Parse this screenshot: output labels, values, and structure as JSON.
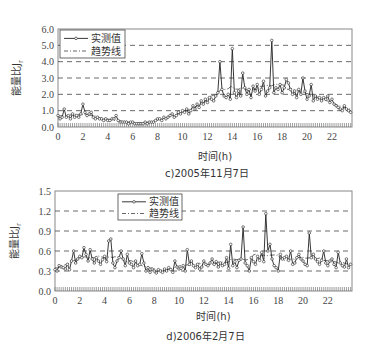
{
  "chart_data": [
    {
      "id": "c",
      "type": "line",
      "caption": "c)2005年11月7日",
      "xlabel": "时间(h)",
      "ylabel": "能量比J",
      "ylabel_sub": "r",
      "xlim": [
        0,
        23.7
      ],
      "ylim": [
        0,
        6.0
      ],
      "xticks": [
        0,
        2,
        4,
        6,
        8,
        10,
        12,
        14,
        16,
        18,
        20,
        22
      ],
      "yticks": [
        "0.0",
        "1.0",
        "2.0",
        "3.0",
        "4.0",
        "5.0",
        "6.0"
      ],
      "grid": "horizontal dashed",
      "legend": {
        "position": "upper left",
        "entries": [
          "实测值",
          "趋势线"
        ]
      },
      "series": [
        {
          "name": "实测值",
          "style": "solid line with circle markers",
          "x_step_h": 0.1667,
          "values": [
            0.7,
            0.5,
            0.6,
            1.1,
            0.6,
            0.7,
            0.5,
            0.8,
            0.6,
            0.7,
            0.6,
            0.8,
            1.4,
            0.9,
            0.7,
            0.8,
            0.9,
            0.6,
            0.5,
            0.6,
            0.5,
            0.5,
            0.4,
            0.5,
            0.4,
            0.4,
            0.5,
            0.5,
            0.7,
            0.4,
            0.3,
            0.3,
            0.3,
            0.3,
            0.2,
            0.3,
            0.3,
            0.2,
            0.2,
            0.2,
            0.2,
            0.2,
            0.3,
            0.2,
            0.3,
            0.3,
            0.3,
            0.4,
            0.5,
            0.5,
            0.4,
            0.6,
            0.5,
            0.6,
            0.7,
            0.8,
            0.6,
            0.7,
            0.9,
            0.8,
            1.0,
            0.9,
            1.1,
            0.8,
            1.0,
            1.3,
            1.1,
            1.4,
            1.2,
            1.6,
            1.4,
            1.7,
            1.5,
            1.8,
            1.7,
            1.6,
            1.9,
            2.1,
            4.0,
            2.3,
            1.9,
            1.8,
            2.0,
            1.7,
            4.8,
            2.1,
            1.8,
            2.2,
            1.9,
            3.3,
            2.4,
            2.0,
            2.3,
            1.8,
            2.5,
            2.2,
            2.6,
            2.0,
            2.3,
            2.8,
            1.9,
            2.2,
            2.4,
            5.3,
            2.1,
            2.4,
            2.3,
            2.6,
            2.1,
            2.4,
            2.9,
            2.7,
            2.3,
            2.0,
            2.2,
            1.8,
            2.3,
            2.0,
            3.0,
            2.2,
            1.7,
            1.9,
            2.6,
            1.6,
            1.9,
            1.7,
            1.8,
            1.6,
            1.8,
            1.7,
            1.9,
            1.5,
            1.7,
            1.4,
            1.3,
            1.2,
            1.1,
            1.0,
            1.3,
            1.1,
            1.0,
            0.9,
            1.2,
            1.1,
            1.0,
            1.2,
            1.1,
            1.0,
            1.3,
            1.4,
            1.2,
            0.9,
            1.0,
            1.1,
            0.8,
            1.0,
            1.2,
            0.9,
            1.1,
            1.0,
            0.9,
            1.1,
            1.0
          ]
        },
        {
          "name": "趋势线",
          "style": "dash-dot line",
          "values_note": "smoothed trend following 实测值"
        }
      ]
    },
    {
      "id": "d",
      "type": "line",
      "caption": "d)2006年2月7日",
      "xlabel": "时间(h)",
      "ylabel": "能量比J",
      "ylabel_sub": "r",
      "xlim": [
        0,
        23.9
      ],
      "ylim": [
        0,
        1.5
      ],
      "xticks": [
        0,
        2,
        4,
        6,
        8,
        10,
        12,
        14,
        16,
        18,
        20,
        22
      ],
      "yticks": [
        "0.0",
        "0.3",
        "0.6",
        "0.9",
        "1.2",
        "1.5"
      ],
      "grid": "horizontal dashed",
      "legend": {
        "position": "upper center",
        "entries": [
          "实测值",
          "趋势线"
        ]
      },
      "series": [
        {
          "name": "实测值",
          "style": "solid line with circle markers",
          "x_step_h": 0.1667,
          "values": [
            0.32,
            0.3,
            0.38,
            0.36,
            0.35,
            0.33,
            0.4,
            0.32,
            0.45,
            0.6,
            0.42,
            0.48,
            0.52,
            0.5,
            0.65,
            0.55,
            0.45,
            0.62,
            0.48,
            0.42,
            0.5,
            0.45,
            0.4,
            0.47,
            0.52,
            0.44,
            0.75,
            0.78,
            0.42,
            0.35,
            0.45,
            0.5,
            0.6,
            0.48,
            0.38,
            0.55,
            0.42,
            0.4,
            0.35,
            0.45,
            0.38,
            0.4,
            0.56,
            0.42,
            0.3,
            0.35,
            0.28,
            0.33,
            0.3,
            0.27,
            0.32,
            0.3,
            0.28,
            0.33,
            0.3,
            0.35,
            0.32,
            0.28,
            0.45,
            0.36,
            0.33,
            0.34,
            0.38,
            0.3,
            0.62,
            0.4,
            0.45,
            0.38,
            0.35,
            0.4,
            0.33,
            0.36,
            0.45,
            0.4,
            0.38,
            0.42,
            0.48,
            0.4,
            0.44,
            0.36,
            0.42,
            0.38,
            0.4,
            0.5,
            0.34,
            0.7,
            0.38,
            0.44,
            0.35,
            0.46,
            0.48,
            0.96,
            0.42,
            0.38,
            0.3,
            0.5,
            0.44,
            0.4,
            0.52,
            0.46,
            0.58,
            0.44,
            1.16,
            0.6,
            0.7,
            0.48,
            0.38,
            0.35,
            0.3,
            0.55,
            0.48,
            0.5,
            0.52,
            0.46,
            0.6,
            0.4,
            0.42,
            0.5,
            0.55,
            0.48,
            0.45,
            0.4,
            0.38,
            0.87,
            0.5,
            0.55,
            0.48,
            0.44,
            0.4,
            0.46,
            0.6,
            0.42,
            0.38,
            0.45,
            0.48,
            0.4,
            0.35,
            0.58,
            0.42,
            0.38,
            0.36,
            0.48,
            0.35,
            0.4,
            0.5,
            0.42,
            0.3,
            0.36,
            0.44,
            0.4,
            0.46,
            0.42,
            0.38,
            0.62,
            0.36,
            0.35,
            0.28,
            0.33,
            0.38,
            0.3,
            0.36,
            0.32,
            0.4,
            0.3,
            0.28,
            0.35,
            0.4,
            0.32,
            0.38,
            0.48
          ]
        },
        {
          "name": "趋势线",
          "style": "dash-dot line",
          "values_note": "smoothed trend following 实测值"
        }
      ]
    }
  ],
  "charts": {
    "c": {
      "caption": "c)2005年11月7日",
      "xlabel": "时间(h)",
      "legend_measured": "实测值",
      "legend_trend": "趋势线"
    },
    "d": {
      "caption": "d)2006年2月7日",
      "xlabel": "时间(h)",
      "legend_measured": "实测值",
      "legend_trend": "趋势线"
    }
  }
}
